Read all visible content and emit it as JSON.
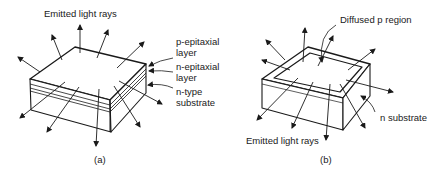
{
  "figure_a": {
    "caption": "(a)",
    "labels": {
      "rays": "Emitted light rays",
      "p_layer_1": "p-epitaxial",
      "p_layer_2": "layer",
      "n_layer_1": "n-epitaxial",
      "n_layer_2": "layer",
      "substrate_1": "n-type",
      "substrate_2": "substrate"
    }
  },
  "figure_b": {
    "caption": "(b)",
    "labels": {
      "p_region": "Diffused p region",
      "substrate": "n substrate",
      "rays": "Emitted light rays"
    }
  },
  "colors": {
    "line": "#1a1a1a",
    "background": "#ffffff"
  }
}
